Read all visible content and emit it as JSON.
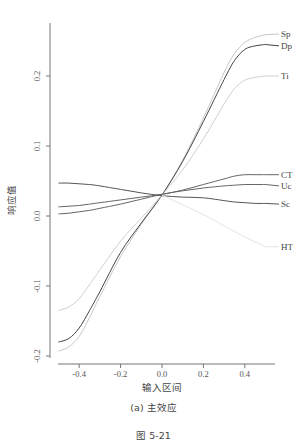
{
  "chart_data": {
    "type": "line",
    "title": "",
    "subtitle": "(a) 主效应",
    "figure_caption": "图 5-21",
    "xlabel": "输入区间",
    "ylabel": "响应值",
    "xlim": [
      -0.52,
      0.54
    ],
    "ylim": [
      -0.21,
      0.275
    ],
    "grid": false,
    "legend_position": "inline-right",
    "x_ticks": [
      "-0.4",
      "-0.2",
      "0.0",
      "0.2",
      "0.4"
    ],
    "x_tick_values": [
      -0.4,
      -0.2,
      0.0,
      0.2,
      0.4
    ],
    "y_ticks": [
      "-0.2",
      "-0.1",
      "0.0",
      "0.1",
      "0.2"
    ],
    "y_tick_values": [
      -0.2,
      -0.1,
      0.0,
      0.1,
      0.2
    ],
    "x": [
      -0.5,
      -0.45,
      -0.4,
      -0.35,
      -0.3,
      -0.2,
      -0.1,
      0.0,
      0.1,
      0.2,
      0.3,
      0.35,
      0.4,
      0.45,
      0.5
    ],
    "series": [
      {
        "name": "Sp",
        "color": "#c8c8c8",
        "values": [
          -0.193,
          -0.187,
          -0.172,
          -0.145,
          -0.115,
          -0.058,
          -0.012,
          0.03,
          0.08,
          0.14,
          0.205,
          0.232,
          0.248,
          0.255,
          0.259
        ]
      },
      {
        "name": "Dp",
        "color": "#444444",
        "values": [
          -0.18,
          -0.175,
          -0.16,
          -0.135,
          -0.108,
          -0.052,
          -0.01,
          0.03,
          0.078,
          0.135,
          0.195,
          0.222,
          0.238,
          0.243,
          0.245
        ]
      },
      {
        "name": "Ti",
        "color": "#d0d0d0",
        "values": [
          -0.135,
          -0.13,
          -0.118,
          -0.098,
          -0.077,
          -0.036,
          -0.003,
          0.03,
          0.066,
          0.11,
          0.16,
          0.182,
          0.194,
          0.198,
          0.2
        ]
      },
      {
        "name": "CT",
        "color": "#666666",
        "values": [
          0.013,
          0.014,
          0.015,
          0.017,
          0.019,
          0.023,
          0.027,
          0.031,
          0.037,
          0.045,
          0.053,
          0.057,
          0.059,
          0.059,
          0.059
        ]
      },
      {
        "name": "Uc",
        "color": "#666666",
        "values": [
          0.003,
          0.004,
          0.006,
          0.008,
          0.011,
          0.017,
          0.024,
          0.031,
          0.036,
          0.04,
          0.043,
          0.044,
          0.045,
          0.045,
          0.045
        ]
      },
      {
        "name": "Sc",
        "color": "#555555",
        "values": [
          0.047,
          0.047,
          0.046,
          0.045,
          0.043,
          0.038,
          0.033,
          0.029,
          0.027,
          0.026,
          0.022,
          0.02,
          0.019,
          0.018,
          0.018
        ]
      },
      {
        "name": "HT",
        "color": "#e4e4e4",
        "values": [
          null,
          null,
          null,
          null,
          null,
          null,
          null,
          0.03,
          0.016,
          0.002,
          -0.014,
          -0.022,
          -0.03,
          -0.037,
          -0.044
        ]
      }
    ],
    "label_positions": {
      "Sp": 0.26,
      "Dp": 0.243,
      "Ti": 0.2,
      "CT": 0.059,
      "Uc": 0.043,
      "Sc": 0.017,
      "HT": -0.044
    }
  }
}
